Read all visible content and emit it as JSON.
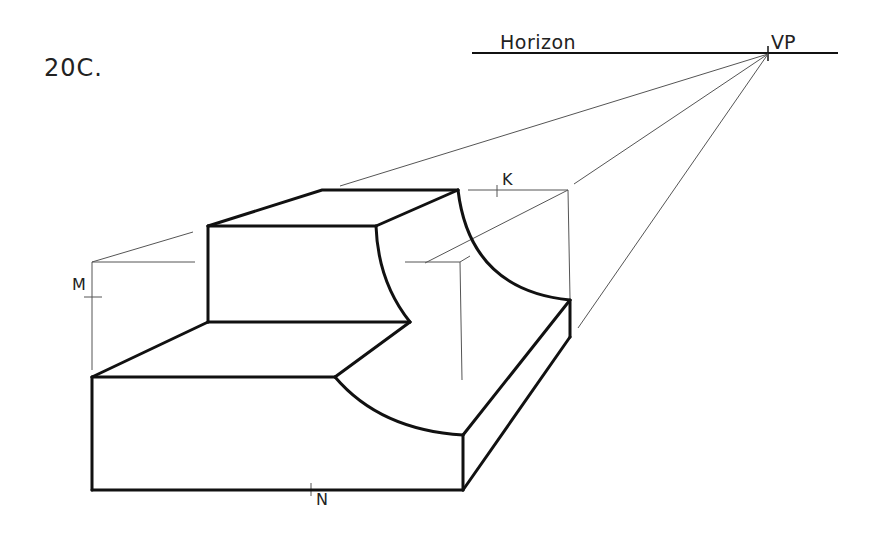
{
  "figure": {
    "label": "20C."
  },
  "annotations": {
    "horizon": "Horizon",
    "vanishing_point": "VP",
    "k": "K",
    "m": "M",
    "n": "N"
  },
  "colors": {
    "background": "#ffffff",
    "object_line": "#111111",
    "construction_line": "#555555",
    "text": "#222222"
  }
}
